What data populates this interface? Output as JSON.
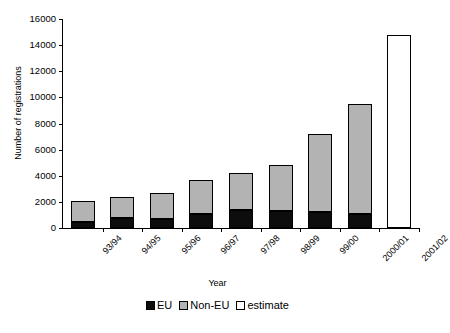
{
  "chart_data": {
    "type": "bar",
    "stacked": true,
    "title": "",
    "xlabel": "Year",
    "ylabel": "Number of registrations",
    "categories": [
      "93/94",
      "94/95",
      "95/96",
      "96/97",
      "97/98",
      "98/99",
      "99/00",
      "2000/01",
      "2001/02"
    ],
    "series": [
      {
        "name": "EU",
        "color": "#0d0d0d",
        "values": [
          450,
          800,
          700,
          1050,
          1350,
          1300,
          1250,
          1100,
          null
        ]
      },
      {
        "name": "Non-EU",
        "color": "#b3b3b3",
        "values": [
          1650,
          1600,
          2000,
          2650,
          2850,
          3500,
          5950,
          8400,
          null
        ]
      },
      {
        "name": "estimate",
        "color": "#ffffff",
        "values": [
          null,
          null,
          null,
          null,
          null,
          null,
          null,
          null,
          14800
        ]
      }
    ],
    "totals": [
      2100,
      2400,
      2700,
      3700,
      4200,
      4800,
      7200,
      9500,
      14800
    ],
    "ylim": [
      0,
      16000
    ],
    "ytick_values": [
      0,
      2000,
      4000,
      6000,
      8000,
      10000,
      12000,
      14000,
      16000
    ],
    "ytick_labels": [
      "0",
      "2000",
      "4000",
      "6000",
      "8000",
      "10000",
      "12000",
      "14000",
      "16000"
    ],
    "grid": false,
    "legend_position": "bottom",
    "legend_entries": [
      {
        "label": "EU",
        "swatch": "black-square-swatch",
        "color": "#0d0d0d"
      },
      {
        "label": "Non-EU",
        "swatch": "gray-square-swatch",
        "color": "#b3b3b3"
      },
      {
        "label": "estimate",
        "swatch": "white-square-swatch",
        "color": "#ffffff"
      }
    ]
  }
}
